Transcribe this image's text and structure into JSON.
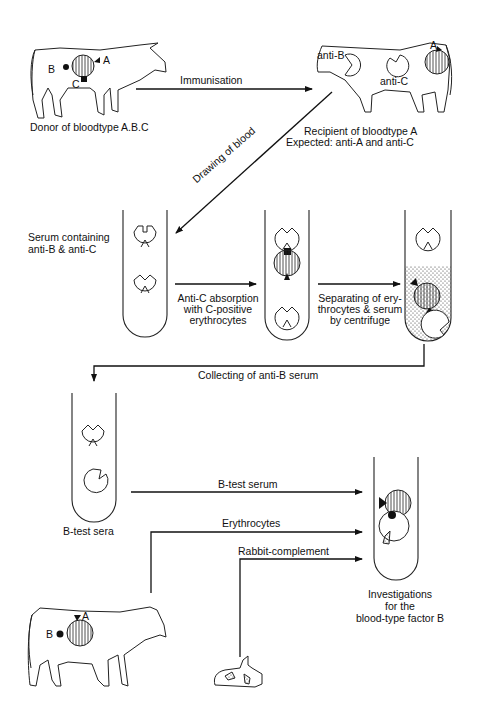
{
  "diagram": {
    "type": "flow-diagram",
    "nodes": {
      "donor": {
        "label": "Donor of bloodtype A.B.C",
        "antigens": [
          "A",
          "B",
          "C"
        ]
      },
      "recipient": {
        "label": "Recipient of bloodtype A",
        "expected": "Expected: anti-A and anti-C",
        "tags": [
          "anti-B",
          "anti-C",
          "A"
        ]
      },
      "tube1": {
        "label_line1": "Serum containing",
        "label_line2": "anti-B & anti-C"
      },
      "tube4": {
        "label": "B-test sera"
      },
      "tube5": {
        "label_line1": "Investigations",
        "label_line2": "for the",
        "label_line3": "blood-type factor B"
      },
      "cow2": {
        "antigens": [
          "A",
          "B"
        ]
      }
    },
    "edges": {
      "immunisation": "Immunisation",
      "drawing": "Drawing of blood",
      "absorption_line1": "Anti-C absorption",
      "absorption_line2": "with C-positive",
      "absorption_line3": "erythrocytes",
      "separating_line1": "Separating of ery-",
      "separating_line2": "throcytes & serum",
      "separating_line3": "by centrifuge",
      "collecting": "Collecting of anti-B serum",
      "btest": "B-test serum",
      "erythrocytes": "Erythrocytes",
      "complement": "Rabbit-complement"
    }
  }
}
